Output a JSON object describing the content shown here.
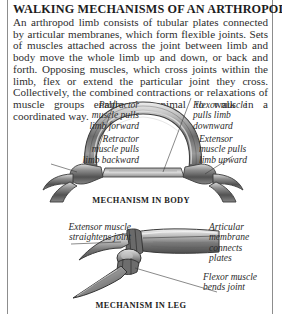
{
  "page": {
    "title": "WALKING MECHANISMS OF AN ARTHROPOD",
    "intro": "An arthropod limb consists of tubular plates connected by articular membranes, which form flexible joints. Sets of muscles attached across the joint between limb and body move the whole limb up and down, or back and forth. Opposing muscles, which cross joints within the limb, flex or extend the particular joint they cross. Collectively, the combined contractions or relaxations of muscle groups enable the animal to walk in a coordinated way."
  },
  "figure_body": {
    "caption": "MECHANISM IN BODY",
    "labels": {
      "protractor": "Protractor\nmuscle pulls\nlimb forward",
      "retractor": "Retractor\nmuscle pulls\nlimb backward",
      "flexor": "Flexor muscle\npulls limb\ndownward",
      "extensor": "Extensor\nmuscle pulls\nlimb upward"
    }
  },
  "figure_leg": {
    "caption": "MECHANISM IN LEG",
    "labels": {
      "extensor": "Extensor muscle\nstraightens joint",
      "articular": "Articular\nmembrane\nconnects\nplates",
      "flexor": "Flexor muscle\nbends joint"
    }
  },
  "colors": {
    "text": "#2b2b2b",
    "heading": "#1d1d1d",
    "rule": "#8d8d8d",
    "background": "#ffffff",
    "engraving_dark": "#4a4a4a",
    "engraving_mid": "#8a8a8a",
    "engraving_light": "#c9c9c9"
  }
}
